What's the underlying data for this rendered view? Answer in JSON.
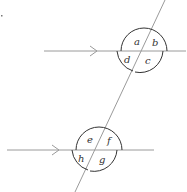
{
  "diagram": {
    "colors": {
      "line": "#9a9a9a",
      "arc": "#333333",
      "label": "#333333"
    },
    "upper_angles": {
      "a": "a",
      "b": "b",
      "c": "c",
      "d": "d"
    },
    "lower_angles": {
      "e": "e",
      "f": "f",
      "g": "g",
      "h": "h"
    }
  }
}
